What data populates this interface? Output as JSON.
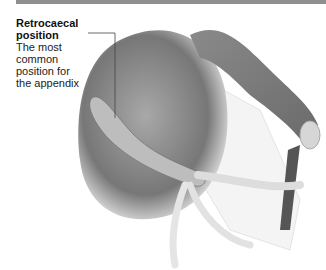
{
  "figure": {
    "label_title_line1": "Retrocaecal",
    "label_title_line2": "position",
    "description_lines": [
      "The most",
      "common",
      "position for",
      "the appendix"
    ]
  },
  "colors": {
    "topbar": "#8f8f8f",
    "organ_dark": "#6e6e6e",
    "organ_mid": "#9a9a9a",
    "organ_light": "#d9d9d9",
    "leader_line": "#444444"
  }
}
